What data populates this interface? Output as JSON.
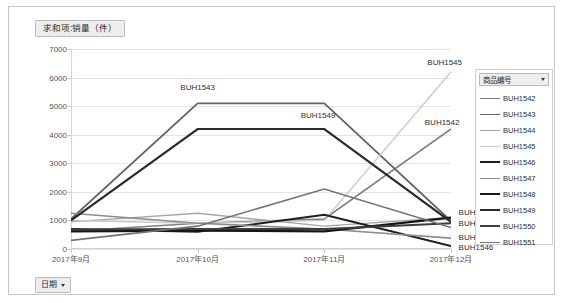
{
  "value_field": {
    "label": "求和项:销量（件）"
  },
  "date_field": {
    "label": "日期"
  },
  "legend": {
    "title": "商品编号",
    "items": [
      {
        "label": "BUH1542",
        "color": "#7f7f7f",
        "width": 1.6
      },
      {
        "label": "BUH1543",
        "color": "#646464",
        "width": 1.8
      },
      {
        "label": "BUH1544",
        "color": "#a6a6a6",
        "width": 1.4
      },
      {
        "label": "BUH1545",
        "color": "#c9c9c9",
        "width": 1.4
      },
      {
        "label": "BUH1546",
        "color": "#1f1f1f",
        "width": 2.0
      },
      {
        "label": "BUH1547",
        "color": "#8c8c8c",
        "width": 1.6
      },
      {
        "label": "BUH1548",
        "color": "#161616",
        "width": 2.2
      },
      {
        "label": "BUH1549",
        "color": "#2b2b2b",
        "width": 2.2
      },
      {
        "label": "BUH1550",
        "color": "#3d3d3d",
        "width": 2.0
      },
      {
        "label": "BUH1551",
        "color": "#737373",
        "width": 1.6
      }
    ]
  },
  "chart_data": {
    "type": "line",
    "title": "求和项:销量（件）",
    "xlabel": "",
    "ylabel": "",
    "grid": true,
    "legend_position": "right",
    "categories": [
      "2017年9月",
      "2017年10月",
      "2017年11月",
      "2017年12月"
    ],
    "ylim": [
      0,
      7000
    ],
    "yticks": [
      0,
      1000,
      2000,
      3000,
      4000,
      5000,
      6000,
      7000
    ],
    "series": [
      {
        "name": "BUH1542",
        "color": "#7f7f7f",
        "values": [
          620,
          900,
          1050,
          4200
        ]
      },
      {
        "name": "BUH1543",
        "color": "#646464",
        "values": [
          1050,
          5100,
          5100,
          980
        ]
      },
      {
        "name": "BUH1544",
        "color": "#a6a6a6",
        "values": [
          950,
          1250,
          800,
          1100
        ]
      },
      {
        "name": "BUH1545",
        "color": "#c9c9c9",
        "values": [
          1000,
          900,
          1000,
          6200
        ]
      },
      {
        "name": "BUH1546",
        "color": "#1f1f1f",
        "values": [
          700,
          600,
          1200,
          100
        ]
      },
      {
        "name": "BUH1547",
        "color": "#8c8c8c",
        "values": [
          1250,
          900,
          700,
          380
        ]
      },
      {
        "name": "BUH1548",
        "color": "#161616",
        "values": [
          620,
          640,
          620,
          1100
        ]
      },
      {
        "name": "BUH1549",
        "color": "#2b2b2b",
        "values": [
          1000,
          4200,
          4200,
          950
        ]
      },
      {
        "name": "BUH1550",
        "color": "#3d3d3d",
        "values": [
          680,
          700,
          700,
          900
        ]
      },
      {
        "name": "BUH1551",
        "color": "#737373",
        "values": [
          300,
          800,
          2100,
          750
        ]
      }
    ],
    "annotations": [
      {
        "text": "BUH1543",
        "x": 1.0,
        "y": 5680,
        "anchor": "center"
      },
      {
        "text": "BUH1549",
        "x": 1.95,
        "y": 4700,
        "anchor": "center"
      },
      {
        "text": "BUH1545",
        "x": 2.95,
        "y": 6550,
        "anchor": "center"
      },
      {
        "text": "BUH1542",
        "x": 2.93,
        "y": 4430,
        "anchor": "center"
      },
      {
        "text": "BUH1548",
        "x": 3.06,
        "y": 1290,
        "anchor": "left"
      },
      {
        "text": "BUH1550",
        "x": 3.06,
        "y": 900,
        "anchor": "left"
      },
      {
        "text": "BUH1547",
        "x": 3.06,
        "y": 420,
        "anchor": "left"
      },
      {
        "text": "BUH1546",
        "x": 3.06,
        "y": 60,
        "anchor": "left"
      }
    ]
  }
}
